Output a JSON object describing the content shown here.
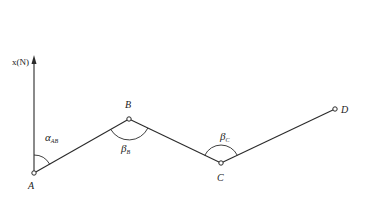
{
  "diagram": {
    "type": "traverse-bearing-diagram",
    "axis": {
      "label": "x(N)",
      "base": [
        34,
        173
      ],
      "tip": [
        34,
        57
      ]
    },
    "points": [
      {
        "id": "A",
        "label": "A",
        "x": 34,
        "y": 173,
        "label_x": 30,
        "label_y": 188
      },
      {
        "id": "B",
        "label": "B",
        "x": 129,
        "y": 119,
        "label_x": 129,
        "label_y": 108
      },
      {
        "id": "C",
        "label": "C",
        "x": 221,
        "y": 163,
        "label_x": 221,
        "label_y": 180
      },
      {
        "id": "D",
        "label": "D",
        "x": 335,
        "y": 109,
        "label_x": 344,
        "label_y": 113
      }
    ],
    "segments": [
      [
        "A",
        "B"
      ],
      [
        "B",
        "C"
      ],
      [
        "C",
        "D"
      ]
    ],
    "angles": [
      {
        "id": "alpha_AB",
        "symbol": "α",
        "subscript": "AB",
        "label_x": 45,
        "label_y": 140,
        "vertex": "A",
        "kind": "azimuth"
      },
      {
        "id": "beta_B",
        "symbol": "β",
        "subscript": "B",
        "label_x": 121,
        "label_y": 152,
        "vertex": "B",
        "kind": "turning"
      },
      {
        "id": "beta_C",
        "symbol": "β",
        "subscript": "C",
        "label_x": 221,
        "label_y": 139,
        "vertex": "C",
        "kind": "turning"
      }
    ],
    "colors": {
      "line": "#2a2a2a",
      "text": "#222222",
      "background": "#ffffff"
    }
  }
}
